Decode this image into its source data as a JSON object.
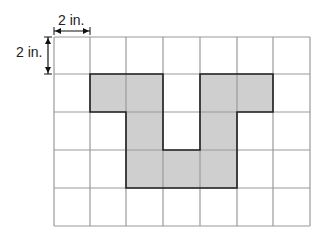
{
  "labels": {
    "horizontal": "2 in.",
    "vertical": "2 in."
  },
  "grid": {
    "columns": 7,
    "rows": 5,
    "cell_size_inches": 2,
    "x_lines": [
      54,
      90,
      126,
      163,
      200,
      237,
      273,
      310
    ],
    "y_lines": [
      37,
      74,
      112,
      150,
      188,
      226
    ],
    "line_color": "#9a9a9a",
    "shade_color": "#cfcfcf",
    "outline_color": "#222222"
  },
  "shaded_cells": [
    [
      1,
      1
    ],
    [
      2,
      1
    ],
    [
      4,
      1
    ],
    [
      5,
      1
    ],
    [
      2,
      2
    ],
    [
      4,
      2
    ],
    [
      2,
      3
    ],
    [
      3,
      3
    ],
    [
      4,
      3
    ]
  ]
}
